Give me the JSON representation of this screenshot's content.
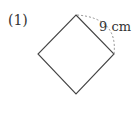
{
  "problem": {
    "number_label": "(1)",
    "shape": "square",
    "side_length_label": "9 cm"
  },
  "colors": {
    "stroke": "#444444",
    "dashed_arc": "#888888",
    "text": "#333333"
  }
}
